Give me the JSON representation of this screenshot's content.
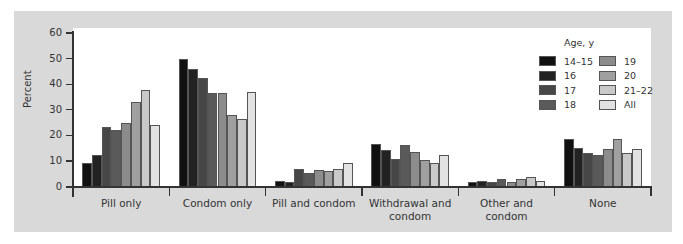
{
  "chart_data": {
    "type": "bar",
    "title": "",
    "xlabel": "",
    "ylabel": "Percent",
    "ylim": [
      0,
      60
    ],
    "yticks": [
      0,
      10,
      20,
      30,
      40,
      50,
      60
    ],
    "grid": false,
    "legend_title": "Age, y",
    "legend_position": "upper right (inside plot)",
    "categories": [
      "Pill only",
      "Condom only",
      "Pill and condom",
      "Withdrawal and condom",
      "Other and condom",
      "None"
    ],
    "series": [
      {
        "name": "14–15",
        "color": "#111111",
        "values": [
          9.3,
          49.9,
          2.3,
          16.6,
          1.6,
          18.6
        ]
      },
      {
        "name": "16",
        "color": "#222222",
        "values": [
          12.4,
          46.1,
          1.9,
          14.3,
          2.3,
          15.1
        ]
      },
      {
        "name": "17",
        "color": "#474747",
        "values": [
          23.2,
          42.6,
          7.0,
          10.8,
          1.6,
          13.2
        ]
      },
      {
        "name": "18",
        "color": "#5a5a5a",
        "values": [
          22.1,
          36.4,
          5.4,
          16.3,
          3.1,
          12.4
        ]
      },
      {
        "name": "19",
        "color": "#8c8c8c",
        "values": [
          24.8,
          36.4,
          6.6,
          13.5,
          1.9,
          14.7
        ]
      },
      {
        "name": "20",
        "color": "#a0a0a0",
        "values": [
          32.9,
          27.9,
          6.2,
          10.5,
          3.1,
          18.6
        ]
      },
      {
        "name": "21–22",
        "color": "#c9c9c9",
        "values": [
          37.9,
          26.3,
          7.0,
          9.3,
          3.9,
          13.2
        ]
      },
      {
        "name": "All",
        "color": "#e2e2e2",
        "values": [
          24.0,
          36.8,
          9.3,
          12.4,
          2.3,
          14.7
        ]
      }
    ]
  },
  "labels": {
    "categories": [
      "Pill only",
      "Condom only",
      "Pill and condom",
      "Withdrawal and\ncondom",
      "Other and condom",
      "None"
    ]
  }
}
